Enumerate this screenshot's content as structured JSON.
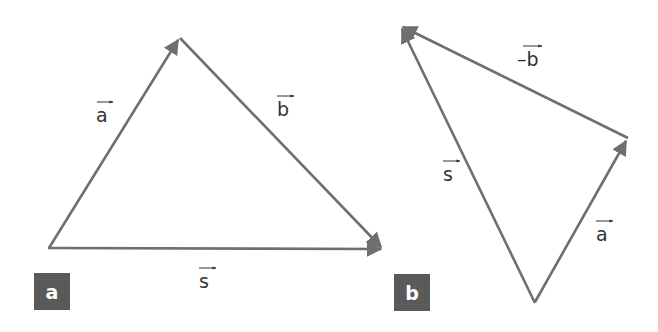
{
  "colors": {
    "stroke": "#6f6f6f",
    "badge_bg": "#5a5a5a",
    "text": "#333333"
  },
  "panel_a": {
    "badge": "a",
    "labels": {
      "a": "a",
      "b": "b",
      "s": "s"
    }
  },
  "panel_b": {
    "badge": "b",
    "labels": {
      "a": "a",
      "neg_b": "–b",
      "s": "s"
    }
  }
}
